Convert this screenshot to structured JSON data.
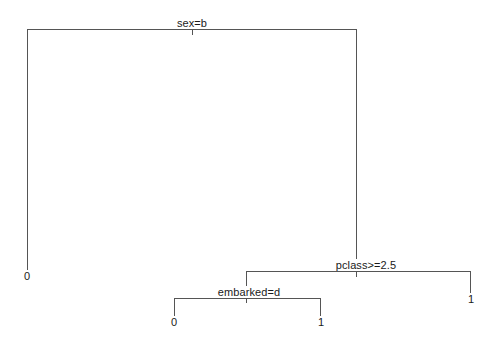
{
  "figure": {
    "type": "decision-tree-diagram",
    "background_color": "#ffffff",
    "line_color": "#555555",
    "text_color": "#1a1a1a",
    "width": 492,
    "height": 349
  },
  "tree": {
    "nodes": [
      {
        "id": "root",
        "kind": "split",
        "label": "sex=b",
        "x": 192,
        "y": 29,
        "label_x": 192,
        "label_y": 18,
        "stem_top": 22,
        "stem_bottom": 34,
        "left_x": 27,
        "right_x": 356
      },
      {
        "id": "pclass",
        "kind": "split",
        "label": "pclass>=2.5",
        "x": 356,
        "y": 271,
        "label_x": 366,
        "label_y": 259,
        "stem_top": 29,
        "stem_bottom": 271,
        "left_x": 246,
        "right_x": 470
      },
      {
        "id": "embarked",
        "kind": "split",
        "label": "embarked=d",
        "x": 246,
        "y": 298,
        "label_x": 249,
        "label_y": 286,
        "stem_top": 271,
        "stem_bottom": 298,
        "left_x": 174,
        "right_x": 320
      },
      {
        "id": "leaf-root-left",
        "kind": "leaf",
        "label": "0",
        "x": 27,
        "stem_top": 29,
        "stem_bottom": 270,
        "label_x": 27,
        "label_y": 270
      },
      {
        "id": "leaf-pclass-right",
        "kind": "leaf",
        "label": "1",
        "x": 470,
        "stem_top": 271,
        "stem_bottom": 293,
        "label_x": 470,
        "label_y": 293
      },
      {
        "id": "leaf-embarked-left",
        "kind": "leaf",
        "label": "0",
        "x": 174,
        "stem_top": 298,
        "stem_bottom": 316,
        "label_x": 174,
        "label_y": 316
      },
      {
        "id": "leaf-embarked-right",
        "kind": "leaf",
        "label": "1",
        "x": 320,
        "stem_top": 298,
        "stem_bottom": 316,
        "label_x": 320,
        "label_y": 316
      }
    ]
  },
  "labels": {
    "root_split": "sex=b",
    "pclass_split": "pclass>=2.5",
    "embarked_split": "embarked=d",
    "leaf_root_left": "0",
    "leaf_pclass_right": "1",
    "leaf_embarked_left": "0",
    "leaf_embarked_right": "1"
  }
}
